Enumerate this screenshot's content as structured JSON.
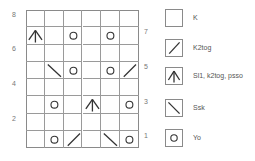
{
  "chart": {
    "columns": 6,
    "rows": 8,
    "left_row_labels": [
      "8",
      "6",
      "4",
      "2"
    ],
    "right_row_labels": [
      "7",
      "5",
      "3",
      "1"
    ],
    "grid_rows_top_to_bottom": [
      [
        "k",
        "k",
        "k",
        "k",
        "k",
        "k"
      ],
      [
        "sl1k2togpsso",
        "k",
        "yo",
        "k",
        "yo",
        "k"
      ],
      [
        "k",
        "k",
        "k",
        "k",
        "k",
        "k"
      ],
      [
        "k",
        "ssk",
        "yo",
        "k",
        "yo",
        "k2tog"
      ],
      [
        "k",
        "k",
        "k",
        "k",
        "k",
        "k"
      ],
      [
        "k",
        "yo",
        "k",
        "sl1k2togpsso",
        "k",
        "yo"
      ],
      [
        "k",
        "k",
        "k",
        "k",
        "k",
        "k"
      ],
      [
        "k",
        "yo",
        "k2tog",
        "k",
        "ssk",
        "yo"
      ]
    ]
  },
  "legend": {
    "items": [
      {
        "symbol": "k",
        "label": "K"
      },
      {
        "symbol": "k2tog",
        "label": "K2tog"
      },
      {
        "symbol": "sl1k2togpsso",
        "label": "Sl1, k2tog, psso"
      },
      {
        "symbol": "ssk",
        "label": "Ssk"
      },
      {
        "symbol": "yo",
        "label": "Yo"
      }
    ]
  },
  "colors": {
    "grid_line": "#9a9a9a",
    "symbol": "#333333",
    "label_text": "#555555"
  }
}
